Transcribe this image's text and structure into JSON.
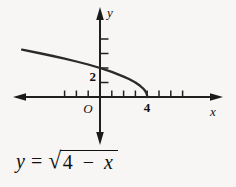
{
  "figure": {
    "axes": {
      "x_label": "x",
      "y_label": "y",
      "origin_label": "O",
      "x_tick_label": "4",
      "y_tick_label": "2"
    },
    "equation": {
      "lhs": "y",
      "equals": "=",
      "radical_symbol": "√",
      "radicand_number": "4",
      "minus": "−",
      "radicand_variable": "x",
      "full": "y = √(4 − x)"
    },
    "colors": {
      "stroke": "#1f1f1f",
      "text": "#111111",
      "background": "#f7f6f4"
    }
  },
  "chart_data": {
    "type": "line",
    "xlabel": "x",
    "ylabel": "y",
    "grid": false,
    "legend": null,
    "axis_arrows": "both-ends-both-axes",
    "x_range_shown": [
      -6.6,
      4
    ],
    "y_range_shown": [
      0,
      4
    ],
    "x_intercept": 4,
    "y_intercept": 2,
    "x_ticks": [
      -3,
      -2,
      -1,
      1,
      2,
      3,
      4,
      5,
      6,
      7
    ],
    "y_ticks": [
      1,
      2,
      3,
      4
    ],
    "labeled_x_ticks": [
      4
    ],
    "labeled_y_ticks": [
      2
    ],
    "points": [
      {
        "x": -6.6,
        "y": 3.26
      },
      {
        "x": -5,
        "y": 3.0
      },
      {
        "x": -4,
        "y": 2.83
      },
      {
        "x": -3,
        "y": 2.65
      },
      {
        "x": -2,
        "y": 2.45
      },
      {
        "x": -1,
        "y": 2.24
      },
      {
        "x": 0,
        "y": 2.0
      },
      {
        "x": 1,
        "y": 1.73
      },
      {
        "x": 2,
        "y": 1.41
      },
      {
        "x": 2.5,
        "y": 1.22
      },
      {
        "x": 3,
        "y": 1.0
      },
      {
        "x": 3.4,
        "y": 0.77
      },
      {
        "x": 3.7,
        "y": 0.55
      },
      {
        "x": 3.85,
        "y": 0.39
      },
      {
        "x": 3.95,
        "y": 0.22
      },
      {
        "x": 3.99,
        "y": 0.1
      },
      {
        "x": 4,
        "y": 0.0
      }
    ]
  }
}
